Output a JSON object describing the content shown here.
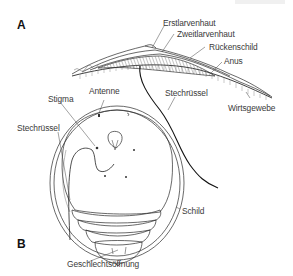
{
  "figure": {
    "panels": [
      {
        "id": "A",
        "label": "A",
        "title": "Lateral section"
      },
      {
        "id": "B",
        "label": "B",
        "title": "Ventral view"
      }
    ],
    "panel_a_labels": {
      "first_larval_skin": "Erstlarvenhaut",
      "second_larval_skin": "Zweitlarvenhaut",
      "dorsal_shield": "Rückenschild",
      "anus": "Anus",
      "proboscis": "Stechrüssel",
      "host_tissue": "Wirtsgewebe"
    },
    "panel_b_labels": {
      "antenna": "Antenne",
      "stigma": "Stigma",
      "proboscis": "Stechrüssel",
      "shield": "Schild",
      "genital_opening": "Geschlechtsöffnung"
    },
    "colors": {
      "line": "#2a2a2a",
      "text": "#3a3a3a",
      "hatch": "#555555",
      "background": "#ffffff"
    }
  }
}
